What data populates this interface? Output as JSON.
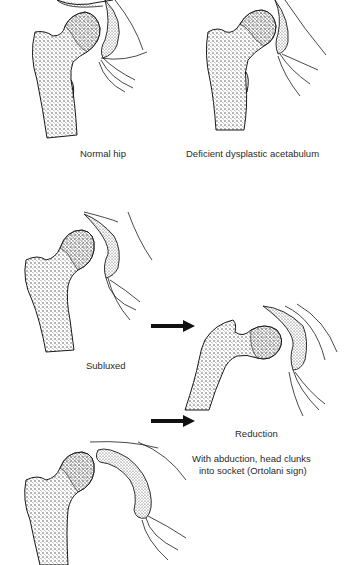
{
  "figure": {
    "colors": {
      "line": "#1a1a1a",
      "stipple": "#333333",
      "background": "#ffffff"
    },
    "panels": [
      {
        "id": "normal",
        "caption": "Normal hip"
      },
      {
        "id": "deficient",
        "caption": "Deficient dysplastic acetabulum"
      },
      {
        "id": "subluxed",
        "caption": "Subluxed"
      },
      {
        "id": "reduction",
        "caption": "Reduction",
        "note_line1": "With abduction, head clunks",
        "note_line2": "into socket (Ortolani sign)"
      },
      {
        "id": "dislocated",
        "caption": ""
      }
    ],
    "arrows": [
      {
        "id": "arrow-to-reduction-upper",
        "icon": "right-arrow-icon"
      },
      {
        "id": "arrow-to-reduction-lower",
        "icon": "right-arrow-icon"
      }
    ]
  }
}
